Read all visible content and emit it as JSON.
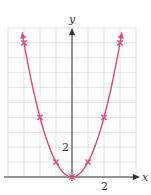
{
  "chart_data": {
    "type": "line",
    "title": "",
    "function": "y = x^2",
    "xlabel": "x",
    "ylabel": "y",
    "xlim": [
      -4,
      4.2
    ],
    "ylim": [
      0,
      10
    ],
    "grid": true,
    "x_tick_labels": [
      {
        "value": 2,
        "label": "2"
      }
    ],
    "y_tick_labels": [
      {
        "value": 2,
        "label": "2"
      }
    ],
    "series": [
      {
        "name": "y = x^2",
        "color": "#e0457b",
        "x": [
          -3,
          -2,
          -1,
          0,
          1,
          2,
          3
        ],
        "y": [
          9,
          4,
          1,
          0,
          1,
          4,
          9
        ],
        "marker": "x",
        "arrows_at_ends": true
      }
    ]
  },
  "axes": {
    "x_label": "x",
    "y_label": "y",
    "x_tick": "2",
    "y_tick": "2"
  },
  "colors": {
    "curve": "#e0457b",
    "grid": "#dcdcdc",
    "axis": "#333333"
  }
}
